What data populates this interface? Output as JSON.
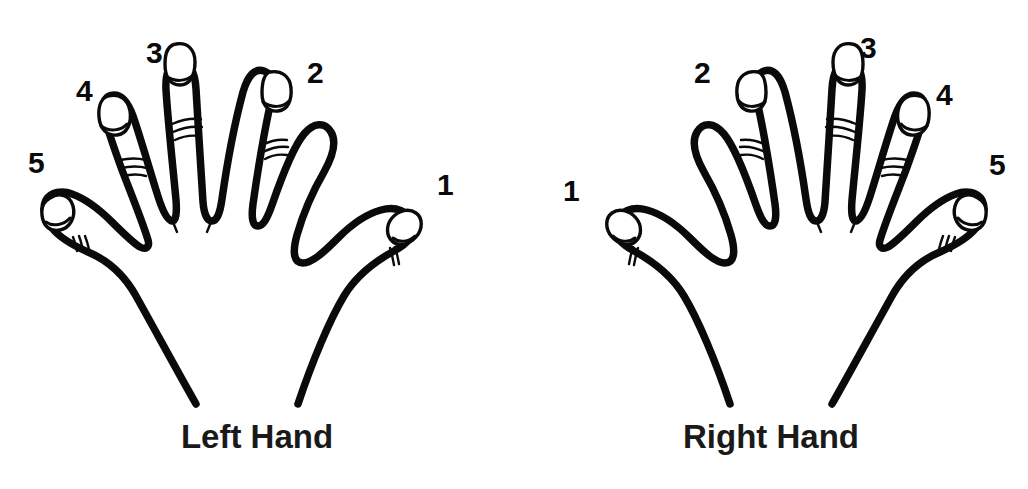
{
  "figure": {
    "background_color": "#ffffff",
    "ink_color": "#0a0a0a",
    "width": 1028,
    "height": 489
  },
  "hands": [
    {
      "id": "left-hand",
      "caption": "Left Hand",
      "caption_x": 260,
      "caption_y": 420,
      "digits": [
        {
          "label": "1",
          "name": "thumb",
          "x": 437,
          "y": 170
        },
        {
          "label": "2",
          "name": "index-finger",
          "x": 307,
          "y": 58
        },
        {
          "label": "3",
          "name": "middle-finger",
          "x": 146,
          "y": 38
        },
        {
          "label": "4",
          "name": "ring-finger",
          "x": 76,
          "y": 76
        },
        {
          "label": "5",
          "name": "little-finger",
          "x": 28,
          "y": 148
        }
      ]
    },
    {
      "id": "right-hand",
      "caption": "Right Hand",
      "caption_x": 294,
      "caption_y": 420,
      "digits": [
        {
          "label": "1",
          "name": "thumb",
          "x": 563,
          "y": 176
        },
        {
          "label": "2",
          "name": "index-finger",
          "x": 694,
          "y": 58
        },
        {
          "label": "3",
          "name": "middle-finger",
          "x": 860,
          "y": 33
        },
        {
          "label": "4",
          "name": "ring-finger",
          "x": 936,
          "y": 80
        },
        {
          "label": "5",
          "name": "little-finger",
          "x": 989,
          "y": 150
        }
      ]
    }
  ]
}
